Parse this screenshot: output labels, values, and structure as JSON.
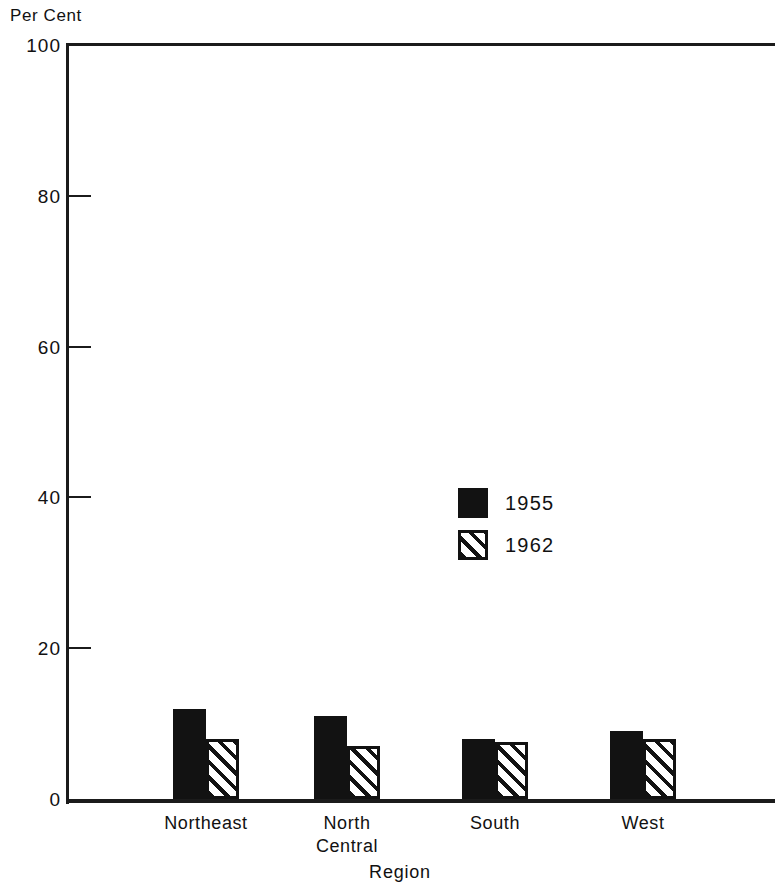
{
  "chart_data": {
    "type": "bar",
    "title": "",
    "ylabel": "Per Cent",
    "xlabel": "Region",
    "categories": [
      "Northeast",
      "North\nCentral",
      "South",
      "West"
    ],
    "series": [
      {
        "name": "1955",
        "style": "solid",
        "values": [
          12,
          11,
          8,
          9
        ]
      },
      {
        "name": "1962",
        "style": "hatch",
        "values": [
          8,
          7,
          7.5,
          8
        ]
      }
    ],
    "ylim": [
      0,
      100
    ],
    "yticks": [
      0,
      20,
      40,
      60,
      80,
      100
    ],
    "ytick_labels": [
      "0",
      "20",
      "40",
      "60",
      "80",
      "100"
    ],
    "grid": false,
    "legend_position": "center"
  },
  "axes": {
    "y_caption": "Per Cent",
    "x_caption": "Region",
    "y_ticks": [
      {
        "value": 100,
        "label": "100"
      },
      {
        "value": 80,
        "label": "80"
      },
      {
        "value": 60,
        "label": "60"
      },
      {
        "value": 40,
        "label": "40"
      },
      {
        "value": 20,
        "label": "20"
      },
      {
        "value": 0,
        "label": "0"
      }
    ]
  },
  "legend": {
    "items": [
      {
        "label": "1955",
        "style": "solid"
      },
      {
        "label": "1962",
        "style": "hatch"
      }
    ]
  },
  "colors": {
    "ink": "#121212",
    "paper": "#ffffff"
  }
}
